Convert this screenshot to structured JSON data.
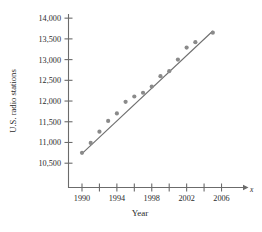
{
  "chart_data": {
    "type": "scatter",
    "title": "",
    "xlabel": "Year",
    "ylabel": "U.S. radio stations",
    "x_axis_variable": "x",
    "xlim": [
      1988.5,
      2007.5
    ],
    "ylim": [
      10300,
      14200
    ],
    "grid": false,
    "legend": "none",
    "x_ticks": [
      1990,
      1992,
      1994,
      1996,
      1998,
      2000,
      2002,
      2004,
      2006
    ],
    "x_tick_labels": [
      "1990",
      "",
      "1994",
      "",
      "1998",
      "",
      "2002",
      "",
      "2006"
    ],
    "y_ticks": [
      10500,
      11000,
      11500,
      12000,
      12500,
      13000,
      13500,
      14000
    ],
    "y_tick_labels": [
      "10,500",
      "11,000",
      "11,500",
      "12,000",
      "12,500",
      "13,000",
      "13,500",
      "14,000"
    ],
    "x": [
      1990,
      1991,
      1992,
      1993,
      1994,
      1995,
      1996,
      1997,
      1998,
      1999,
      2000,
      2001,
      2002,
      2003,
      2005
    ],
    "values": [
      10750,
      10990,
      11260,
      11520,
      11700,
      11980,
      12110,
      12200,
      12350,
      12600,
      12720,
      13000,
      13290,
      13420,
      13650
    ],
    "series": [
      {
        "name": "U.S. radio stations",
        "type": "scatter",
        "marker_color": "#8a8a8a",
        "points": [
          {
            "x": 1990,
            "y": 10750
          },
          {
            "x": 1991,
            "y": 10990
          },
          {
            "x": 1992,
            "y": 11260
          },
          {
            "x": 1993,
            "y": 11520
          },
          {
            "x": 1994,
            "y": 11700
          },
          {
            "x": 1995,
            "y": 11980
          },
          {
            "x": 1996,
            "y": 12110
          },
          {
            "x": 1997,
            "y": 12200
          },
          {
            "x": 1998,
            "y": 12350
          },
          {
            "x": 1999,
            "y": 12600
          },
          {
            "x": 2000,
            "y": 12720
          },
          {
            "x": 2001,
            "y": 13000
          },
          {
            "x": 2002,
            "y": 13290
          },
          {
            "x": 2003,
            "y": 13420
          },
          {
            "x": 2005,
            "y": 13650
          }
        ]
      },
      {
        "name": "regression-line",
        "type": "line",
        "line_color": "#6e6e6e",
        "endpoints": [
          {
            "x": 1990,
            "y": 10730
          },
          {
            "x": 2005,
            "y": 13690
          }
        ]
      }
    ]
  },
  "axis": {
    "x_variable_glyph": "x"
  }
}
